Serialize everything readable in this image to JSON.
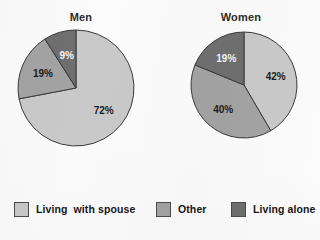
{
  "chart_data": [
    {
      "type": "pie",
      "title": "Men",
      "categories": [
        "Living with spouse",
        "Other",
        "Living alone"
      ],
      "values": [
        72,
        19,
        9
      ],
      "labels": [
        "72%",
        "19%",
        "9%"
      ],
      "colors": [
        "#c9c9c9",
        "#a3a3a3",
        "#6f6f6f"
      ],
      "label_on_dark": [
        false,
        false,
        true
      ],
      "start_angle_deg": 0,
      "direction": "clockwise",
      "legend_position": "bottom"
    },
    {
      "type": "pie",
      "title": "Women",
      "categories": [
        "Living with spouse",
        "Other",
        "Living alone"
      ],
      "values": [
        42,
        40,
        19
      ],
      "labels": [
        "42%",
        "40%",
        "19%"
      ],
      "colors": [
        "#c9c9c9",
        "#a3a3a3",
        "#6f6f6f"
      ],
      "label_on_dark": [
        false,
        false,
        true
      ],
      "start_angle_deg": 0,
      "direction": "clockwise",
      "legend_position": "bottom"
    }
  ],
  "charts": {
    "men": {
      "title": "Men",
      "slices": [
        {
          "label": "72%",
          "value": 72,
          "color": "#c9c9c9",
          "on_dark": false
        },
        {
          "label": "19%",
          "value": 19,
          "color": "#a3a3a3",
          "on_dark": false
        },
        {
          "label": "9%",
          "value": 9,
          "color": "#6f6f6f",
          "on_dark": true
        }
      ]
    },
    "women": {
      "title": "Women",
      "slices": [
        {
          "label": "42%",
          "value": 42,
          "color": "#c9c9c9",
          "on_dark": false
        },
        {
          "label": "40%",
          "value": 40,
          "color": "#a3a3a3",
          "on_dark": false
        },
        {
          "label": "19%",
          "value": 19,
          "color": "#6f6f6f",
          "on_dark": true
        }
      ]
    }
  },
  "legend": {
    "items": [
      {
        "label": "Living  with spouse",
        "color": "#c9c9c9"
      },
      {
        "label": "Other",
        "color": "#a3a3a3"
      },
      {
        "label": "Living alone",
        "color": "#6f6f6f"
      }
    ]
  },
  "style": {
    "slice_outline": "#3a3a3a",
    "background": "#fbfbfb"
  }
}
